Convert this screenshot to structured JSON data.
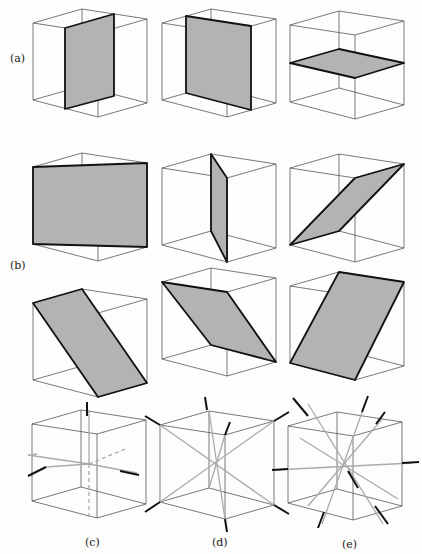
{
  "figure": {
    "labels": {
      "a": "(a)",
      "b": "(b)",
      "c": "(c)",
      "d": "(d)",
      "e": "(e)"
    },
    "rows": [
      {
        "id": "a",
        "description": "Three cubes each with a shaded plane parallel to a pair of cube faces (mirror planes)",
        "count": 3
      },
      {
        "id": "b",
        "description": "Six cubes each with a shaded diagonal plane through opposite edges (mirror planes)",
        "count": 6
      },
      {
        "id": "c",
        "description": "Cube with three 4-fold rotation axes through face centers",
        "count": 1
      },
      {
        "id": "d",
        "description": "Cube with four 3-fold rotation axes through body diagonals",
        "count": 1
      },
      {
        "id": "e",
        "description": "Cube with six 2-fold rotation axes through edge midpoints",
        "count": 1
      }
    ],
    "colors": {
      "plane_fill": "#b3b3b3",
      "plane_edge": "#111111",
      "cube_edge": "#555555",
      "axis": "#aaaaaa"
    }
  }
}
